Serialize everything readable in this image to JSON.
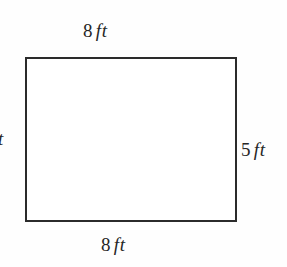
{
  "figure": {
    "name": "rectangle-dimension-diagram",
    "background_color": "#fefefe",
    "stroke_color": "#2b2b2b",
    "text_color": "#262626",
    "shape": {
      "type": "rectangle",
      "width_label": "8 ft",
      "height_label": "5 ft"
    },
    "labels": {
      "top": {
        "number": "8",
        "unit": "ft"
      },
      "bottom": {
        "number": "8",
        "unit": "ft"
      },
      "right": {
        "number": "5",
        "unit": "ft"
      },
      "left": {
        "number": "",
        "unit": "ft"
      }
    },
    "corner_fragment": "f"
  },
  "chart_data": {
    "type": "diagram",
    "title": "",
    "shape": "rectangle",
    "measurements": [
      {
        "side": "top",
        "value": 8,
        "unit": "ft",
        "text": "8 ft"
      },
      {
        "side": "bottom",
        "value": 8,
        "unit": "ft",
        "text": "8 ft"
      },
      {
        "side": "right",
        "value": 5,
        "unit": "ft",
        "text": "5 ft"
      },
      {
        "side": "left",
        "value": 5,
        "unit": "ft",
        "text": "5 ft"
      }
    ]
  }
}
